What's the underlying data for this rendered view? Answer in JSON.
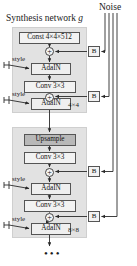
{
  "figure": {
    "synthesis_title": "Synthesis network ",
    "synthesis_title_italic": "g",
    "noise_title": "Noise",
    "ellipsis": "•••"
  },
  "stages": [
    {
      "name": "stage-4x4",
      "resolution_label": "4×4"
    },
    {
      "name": "stage-8x8",
      "resolution_label": "8×8"
    }
  ],
  "nodes": {
    "const": "Const 4×4×512",
    "conv": "Conv 3×3",
    "adain": "AdaIN",
    "upsample": "Upsample",
    "noise_scale": "B",
    "sum": "+",
    "style": "style"
  },
  "blocks": [
    {
      "id": "box-const",
      "label": "Const 4×4×512",
      "fill": "#f2f2f2"
    },
    {
      "id": "box-adain-1",
      "label": "AdaIN",
      "fill": "#efefef"
    },
    {
      "id": "box-conv-1",
      "label": "Conv 3×3",
      "fill": "#f2f2f2"
    },
    {
      "id": "box-adain-2",
      "label": "AdaIN",
      "fill": "#efefef"
    },
    {
      "id": "box-upsample",
      "label": "Upsample",
      "fill": "#b8b8b8"
    },
    {
      "id": "box-conv-2",
      "label": "Conv 3×3",
      "fill": "#f2f2f2"
    },
    {
      "id": "box-adain-3",
      "label": "AdaIN",
      "fill": "#efefef"
    },
    {
      "id": "box-conv-3",
      "label": "Conv 3×3",
      "fill": "#f2f2f2"
    },
    {
      "id": "box-adain-4",
      "label": "AdaIN",
      "fill": "#efefef"
    }
  ],
  "noise_boxes": [
    {
      "id": "b-1",
      "label": "B"
    },
    {
      "id": "b-2",
      "label": "B"
    },
    {
      "id": "b-3",
      "label": "B"
    },
    {
      "id": "b-4",
      "label": "B"
    }
  ],
  "sum_nodes": [
    {
      "id": "sum-1",
      "label": "+"
    },
    {
      "id": "sum-2",
      "label": "+"
    },
    {
      "id": "sum-3",
      "label": "+"
    },
    {
      "id": "sum-4",
      "label": "+"
    }
  ],
  "style_labels": [
    {
      "id": "style-1",
      "label": "style"
    },
    {
      "id": "style-2",
      "label": "style"
    },
    {
      "id": "style-3",
      "label": "style"
    },
    {
      "id": "style-4",
      "label": "style"
    }
  ],
  "colors": {
    "panel_bg": "#e2e2e2",
    "box_fill": "#f2f2f2",
    "upsample_fill": "#b8b8b8",
    "stroke": "#555555",
    "text": "#1b1b1b",
    "page_bg": "#ffffff"
  }
}
